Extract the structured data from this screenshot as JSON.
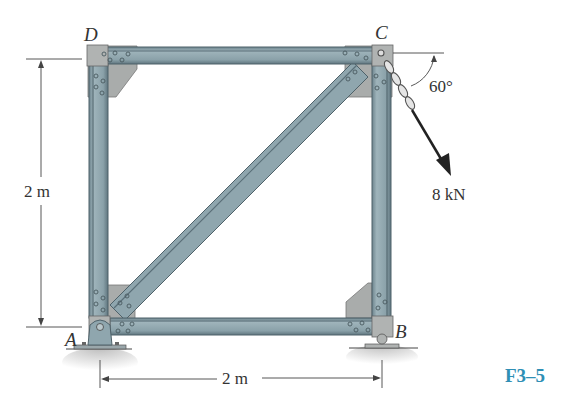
{
  "figure": {
    "id_label": "F3–5",
    "id_color": "#2f8fb5"
  },
  "nodes": {
    "A": "A",
    "B": "B",
    "C": "C",
    "D": "D"
  },
  "dimensions": {
    "height_label": "2 m",
    "width_label": "2 m"
  },
  "load": {
    "magnitude_label": "8 kN",
    "angle_label": "60°"
  },
  "colors": {
    "member_fill": "#8fa6ae",
    "member_dark": "#5a6f78",
    "gusset": "#a9acab",
    "ground": "#c9c9c9"
  }
}
